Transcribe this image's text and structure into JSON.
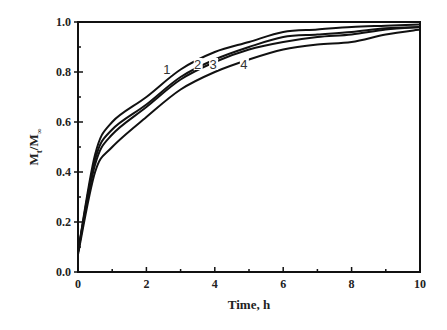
{
  "chart_data": {
    "type": "line",
    "title": "",
    "xlabel": "Time, h",
    "ylabel": "Mt/M∞",
    "ylabel_main": "M",
    "ylabel_sub1": "t",
    "ylabel_mid": "/M",
    "ylabel_sub2": "∞",
    "xlim": [
      0,
      10
    ],
    "ylim": [
      0.0,
      1.0
    ],
    "x_ticks": [
      0,
      2,
      4,
      6,
      8,
      10
    ],
    "x_tick_labels": [
      "0",
      "2",
      "4",
      "6",
      "8",
      "10"
    ],
    "y_ticks": [
      0.0,
      0.2,
      0.4,
      0.6,
      0.8,
      1.0
    ],
    "y_tick_labels": [
      "0.0",
      "0.2",
      "0.4",
      "0.6",
      "0.8",
      "1.0"
    ],
    "grid": false,
    "legend": "inline curve labels",
    "x": [
      0,
      0.5,
      1,
      2,
      3,
      4,
      5,
      6,
      7,
      8,
      9,
      10
    ],
    "series": [
      {
        "name": "1",
        "values": [
          0.08,
          0.47,
          0.6,
          0.7,
          0.81,
          0.88,
          0.92,
          0.96,
          0.97,
          0.98,
          0.985,
          0.99
        ]
      },
      {
        "name": "2",
        "values": [
          0.08,
          0.45,
          0.57,
          0.67,
          0.78,
          0.85,
          0.9,
          0.94,
          0.95,
          0.96,
          0.975,
          0.98
        ]
      },
      {
        "name": "3",
        "values": [
          0.08,
          0.43,
          0.55,
          0.66,
          0.77,
          0.84,
          0.89,
          0.92,
          0.94,
          0.95,
          0.97,
          0.98
        ]
      },
      {
        "name": "4",
        "values": [
          0.07,
          0.4,
          0.5,
          0.62,
          0.73,
          0.8,
          0.85,
          0.89,
          0.91,
          0.92,
          0.95,
          0.97
        ]
      }
    ],
    "curve_labels": [
      {
        "text": "1",
        "x": 2.6,
        "y": 0.8
      },
      {
        "text": "2",
        "x": 3.5,
        "y": 0.82
      },
      {
        "text": "3",
        "x": 3.95,
        "y": 0.82
      },
      {
        "text": "4",
        "x": 4.85,
        "y": 0.82
      }
    ]
  }
}
